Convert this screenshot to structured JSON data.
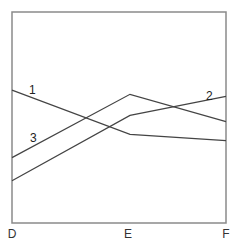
{
  "chart_data": {
    "type": "line",
    "title": "",
    "xlabel": "",
    "ylabel": "",
    "categories": [
      "D",
      "E",
      "F"
    ],
    "grid": false,
    "legend": "inline numeric labels on lines",
    "ylim": [
      0,
      100
    ],
    "series": [
      {
        "name": "1",
        "values": [
          63,
          42,
          39
        ]
      },
      {
        "name": "2",
        "values": [
          20,
          51,
          60
        ]
      },
      {
        "name": "3",
        "values": [
          31,
          61,
          48
        ]
      }
    ],
    "colors": {
      "frame": "#888888",
      "lines": "#444444"
    }
  },
  "labels": {
    "x": [
      "D",
      "E",
      "F"
    ],
    "series": [
      "1",
      "2",
      "3"
    ]
  }
}
